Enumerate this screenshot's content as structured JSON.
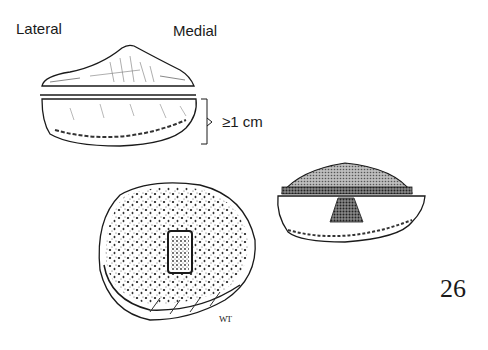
{
  "figure": {
    "number": "26",
    "signature": "WT",
    "labels": {
      "lateral": "Lateral",
      "medial": "Medial",
      "thickness": "≥1 cm"
    },
    "panels": [
      {
        "name": "patella-articular-surface-profile",
        "description": "Resected articular surface wedge (top view profile)"
      },
      {
        "name": "patella-remnant-side-view",
        "description": "Remaining patellar bone, thickness at least 1 cm"
      },
      {
        "name": "patella-cut-surface-with-slot",
        "description": "Cut cancellous bone surface with rectangular peg slot"
      },
      {
        "name": "patella-with-button-implant",
        "description": "Patella with dome-shaped implant and central peg"
      }
    ],
    "colors": {
      "ink": "#1a1a1a",
      "background": "#ffffff",
      "stipple": "#555555"
    }
  }
}
